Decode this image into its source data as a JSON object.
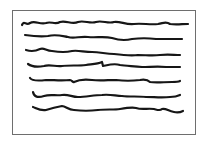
{
  "illustration": {
    "subject": "hand-drawn page with scribbled text lines",
    "frame": {
      "stroke_color": "#6e6e6e",
      "fill": "#ffffff"
    },
    "line_color": "#161616",
    "line_count": 7,
    "lines": [
      {
        "index": 1,
        "y": 24
      },
      {
        "index": 2,
        "y": 37
      },
      {
        "index": 3,
        "y": 51
      },
      {
        "index": 4,
        "y": 65
      },
      {
        "index": 5,
        "y": 80
      },
      {
        "index": 6,
        "y": 96
      },
      {
        "index": 7,
        "y": 110
      }
    ]
  }
}
